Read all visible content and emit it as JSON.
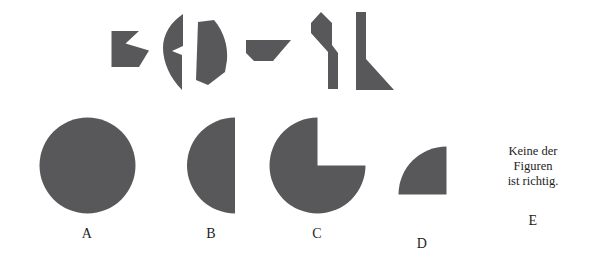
{
  "meta": {
    "language": "de",
    "task_type": "figure-assembly",
    "shape_fill_color": "#58585a",
    "background_color": "#ffffff",
    "text_color": "#1d1d1d",
    "canvas_width": 607,
    "canvas_height": 258
  },
  "pieces": {
    "count": 6,
    "items": [
      {
        "id": "piece-1",
        "name": "arrow-notch-piece",
        "description": "pentagon with V-notch cut into right edge",
        "x": 111,
        "y": 30,
        "width": 38,
        "height": 38
      },
      {
        "id": "piece-2",
        "name": "crescent-sliver-piece",
        "description": "thin curved crescent sliver with step notch on right",
        "x": 162,
        "y": 14,
        "width": 24,
        "height": 74
      },
      {
        "id": "piece-3",
        "name": "curved-panel-piece",
        "description": "quadrilateral panel with convex curved right edge",
        "x": 194,
        "y": 20,
        "width": 34,
        "height": 64
      },
      {
        "id": "piece-4",
        "name": "wedge-trapezoid-piece",
        "description": "trapezoid with diagonal right edge and clipped bottom-left corner",
        "x": 246,
        "y": 40,
        "width": 44,
        "height": 24
      },
      {
        "id": "piece-5",
        "name": "bent-bar-piece",
        "description": "bent elbow bar, hockey-stick shape",
        "x": 307,
        "y": 12,
        "width": 35,
        "height": 76
      },
      {
        "id": "piece-6",
        "name": "bar-with-foot-piece",
        "description": "vertical bar with triangular foot at bottom right",
        "x": 355,
        "y": 12,
        "width": 38,
        "height": 80
      }
    ]
  },
  "options": {
    "count": 5,
    "items": [
      {
        "id": "option-a",
        "label": "A",
        "shape": "full-circle",
        "shape_name": "circle-figure",
        "description": "complete filled circle",
        "x": 38,
        "y": 117,
        "size": 97
      },
      {
        "id": "option-b",
        "label": "B",
        "shape": "half-circle-left",
        "shape_name": "half-circle-figure",
        "description": "left half of a circle, flat edge on the right",
        "x": 172,
        "y": 117,
        "size": 97
      },
      {
        "id": "option-c",
        "label": "C",
        "shape": "three-quarter-circle",
        "shape_name": "three-quarter-circle-figure",
        "description": "circle with upper-right quadrant removed",
        "x": 263,
        "y": 117,
        "size": 97
      },
      {
        "id": "option-d",
        "label": "D",
        "shape": "quarter-circle",
        "shape_name": "quarter-circle-figure",
        "description": "quarter circle, curve on upper-left, flat right and bottom edges",
        "x": 384,
        "y": 146,
        "size": 49
      },
      {
        "id": "option-e",
        "label": "E",
        "shape": "text-only",
        "shape_name": "none-of-the-figures-text",
        "text_lines": [
          "Keine der",
          "Figuren",
          "ist richtig."
        ],
        "x": 494,
        "y": 152
      }
    ]
  }
}
